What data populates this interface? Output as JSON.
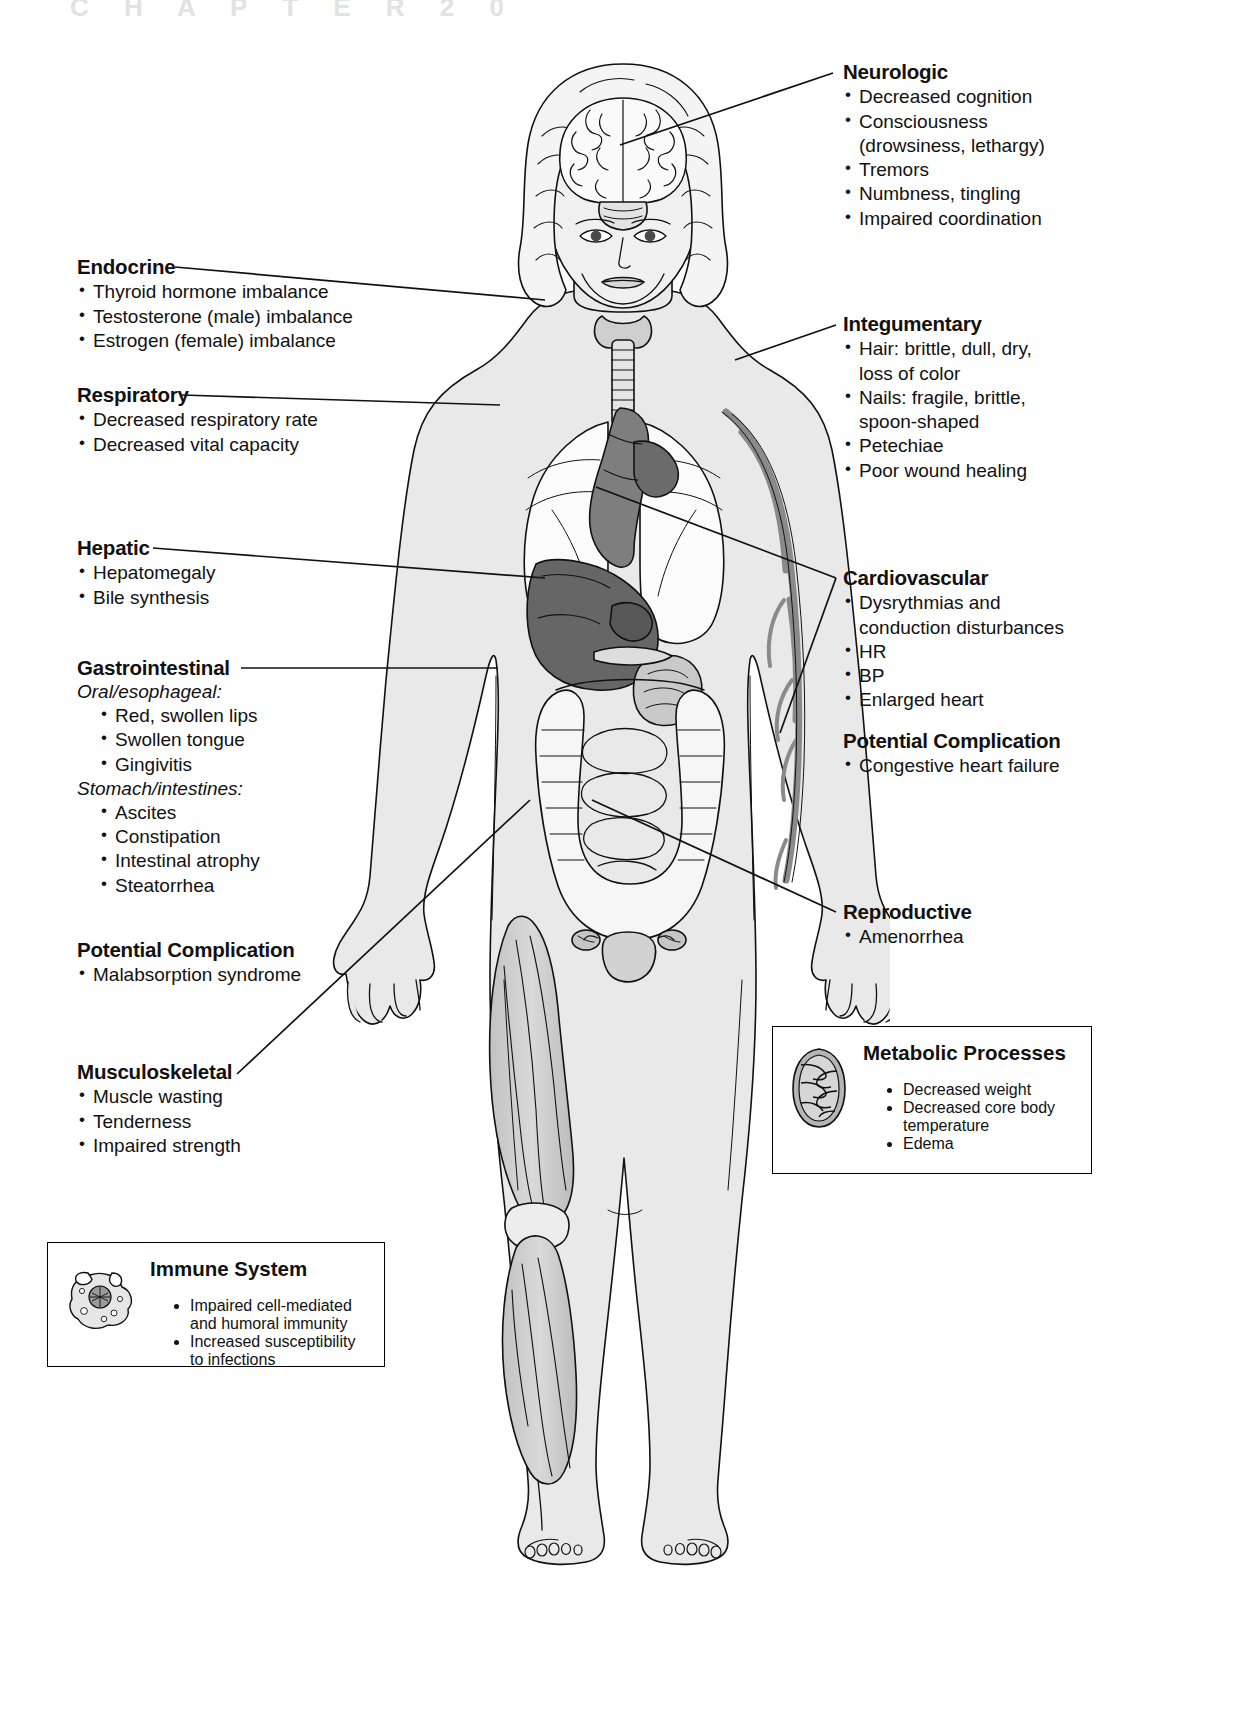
{
  "page": {
    "chapter_watermark": "C H A P T E R   2 0",
    "figure_title": "Systemic effects of malnutrition"
  },
  "callouts": [
    {
      "id": "neurologic",
      "title": "Neurologic",
      "items": [
        "Decreased cognition",
        "Consciousness (drowsiness, lethargy)",
        "Tremors",
        "Numbness, tingling",
        "Impaired coordination"
      ],
      "lines": [
        [
          "Decreased cognition"
        ],
        [
          "Consciousness",
          "(drowsiness, lethargy)"
        ],
        [
          "Tremors"
        ],
        [
          "Numbness, tingling"
        ],
        [
          "Impaired coordination"
        ]
      ]
    },
    {
      "id": "integumentary",
      "title": "Integumentary",
      "lines": [
        [
          "Hair: brittle, dull, dry,",
          "loss of color"
        ],
        [
          "Nails: fragile, brittle,",
          "spoon-shaped"
        ],
        [
          "Petechiae"
        ],
        [
          "Poor wound healing"
        ]
      ]
    },
    {
      "id": "cardiovascular",
      "title": "Cardiovascular",
      "lines": [
        [
          "Dysrythmias and",
          "conduction disturbances"
        ],
        [
          "HR"
        ],
        [
          "BP"
        ],
        [
          "Enlarged heart"
        ]
      ],
      "complication_title": "Potential Complication",
      "complication_lines": [
        [
          "Congestive heart failure"
        ]
      ]
    },
    {
      "id": "reproductive",
      "title": "Reproductive",
      "lines": [
        [
          "Amenorrhea"
        ]
      ]
    },
    {
      "id": "endocrine",
      "title": "Endocrine",
      "lines": [
        [
          "Thyroid hormone imbalance"
        ],
        [
          "Testosterone (male) imbalance"
        ],
        [
          "Estrogen (female) imbalance"
        ]
      ]
    },
    {
      "id": "respiratory",
      "title": "Respiratory",
      "lines": [
        [
          "Decreased respiratory rate"
        ],
        [
          "Decreased vital capacity"
        ]
      ]
    },
    {
      "id": "hepatic",
      "title": "Hepatic",
      "lines": [
        [
          "Hepatomegaly"
        ],
        [
          "Bile synthesis"
        ]
      ]
    },
    {
      "id": "gastrointestinal",
      "title": "Gastrointestinal",
      "sub1": "Oral/esophageal:",
      "group1": [
        [
          "Red, swollen lips"
        ],
        [
          "Swollen tongue"
        ],
        [
          "Gingivitis"
        ]
      ],
      "sub2": "Stomach/intestines:",
      "group2": [
        [
          "Ascites"
        ],
        [
          "Constipation"
        ],
        [
          "Intestinal atrophy"
        ],
        [
          "Steatorrhea"
        ]
      ],
      "complication_title": "Potential Complication",
      "complication_lines": [
        [
          "Malabsorption syndrome"
        ]
      ]
    },
    {
      "id": "musculoskeletal",
      "title": "Musculoskeletal",
      "lines": [
        [
          "Muscle wasting"
        ],
        [
          "Tenderness"
        ],
        [
          "Impaired strength"
        ]
      ]
    }
  ],
  "boxes": [
    {
      "id": "immune-system",
      "title": "Immune System",
      "icon": "macrophage-cell-icon",
      "lines": [
        [
          "Impaired cell-mediated",
          "and humoral immunity"
        ],
        [
          "Increased susceptibility",
          "to infections"
        ]
      ]
    },
    {
      "id": "metabolic-processes",
      "title": "Metabolic Processes",
      "icon": "mitochondrion-icon",
      "lines": [
        [
          "Decreased weight"
        ],
        [
          "Decreased core body",
          "temperature"
        ],
        [
          "Edema"
        ]
      ]
    }
  ],
  "figure_parts": {
    "brain": "brain",
    "thyroid": "thyroid-gland",
    "lungs": "lungs",
    "heart": "heart",
    "liver": "liver",
    "stomach": "stomach",
    "intestines": "intestines",
    "uterus": "uterus-ovaries",
    "vessels": "blood-vessels",
    "muscles": "leg-muscles"
  },
  "colors": {
    "ink": "#111111",
    "skin": "#e9e9e9",
    "organ_light": "#f2f2f2",
    "organ_mid": "#bdbdbd",
    "organ_dark": "#8f8f8f",
    "organ_darkest": "#6b6b6b",
    "vessel": "#8a8a8a",
    "muscle": "#c9c9c9",
    "watermark": "#e2e2e2"
  }
}
